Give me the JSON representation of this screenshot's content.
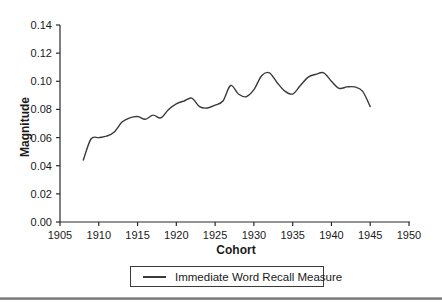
{
  "figure": {
    "background_color": "#ffffff",
    "axis_color": "#2a2a2a",
    "text_color": "#1a1a1a",
    "divider_color": "#7a7a7a"
  },
  "legend": {
    "entries": [
      {
        "label": "Immediate Word Recall Measure",
        "line_color": "#3a3a3a"
      }
    ]
  },
  "chart_data": {
    "type": "line",
    "title": "",
    "xlabel": "Cohort",
    "ylabel": "Magnitude",
    "xlim": [
      1905,
      1950
    ],
    "ylim": [
      0,
      0.14
    ],
    "grid": false,
    "legend_position": "bottom-center-boxed",
    "x_tick_values": [
      1905,
      1910,
      1915,
      1920,
      1925,
      1930,
      1935,
      1940,
      1945,
      1950
    ],
    "x_tick_labels": [
      "1905",
      "1910",
      "1915",
      "1920",
      "1925",
      "1930",
      "1935",
      "1940",
      "1945",
      "1950"
    ],
    "y_tick_values": [
      0.0,
      0.02,
      0.04,
      0.06,
      0.08,
      0.1,
      0.12,
      0.14
    ],
    "y_tick_labels": [
      "0.00",
      "0.02",
      "0.04",
      "0.06",
      "0.08",
      "0.10",
      "0.12",
      "0.14"
    ],
    "series": [
      {
        "name": "Immediate Word Recall Measure",
        "color": "#3a3a3a",
        "x": [
          1908,
          1909,
          1910,
          1911,
          1912,
          1913,
          1914,
          1915,
          1916,
          1917,
          1918,
          1919,
          1920,
          1921,
          1922,
          1923,
          1924,
          1925,
          1926,
          1927,
          1928,
          1929,
          1930,
          1931,
          1932,
          1933,
          1934,
          1935,
          1936,
          1937,
          1938,
          1939,
          1940,
          1941,
          1942,
          1943,
          1944,
          1945
        ],
        "values": [
          0.044,
          0.059,
          0.06,
          0.061,
          0.064,
          0.071,
          0.074,
          0.075,
          0.073,
          0.076,
          0.074,
          0.08,
          0.084,
          0.086,
          0.088,
          0.082,
          0.081,
          0.083,
          0.086,
          0.097,
          0.091,
          0.089,
          0.094,
          0.104,
          0.106,
          0.099,
          0.093,
          0.091,
          0.097,
          0.103,
          0.105,
          0.106,
          0.1,
          0.095,
          0.096,
          0.096,
          0.093,
          0.082
        ]
      }
    ]
  }
}
